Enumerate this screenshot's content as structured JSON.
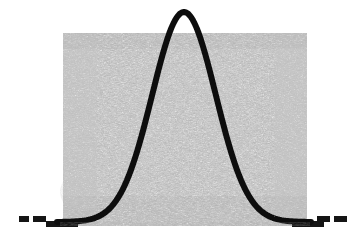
{
  "figure": {
    "kind": "scanned-bell-curve-figure",
    "width": 362,
    "height": 246,
    "background_color": "#ffffff",
    "ink_color": "#1a1a1a",
    "shading_color": "#8d8d8d",
    "has_visible_text": false,
    "title": "",
    "caption": ""
  },
  "chart_data": {
    "type": "line",
    "title": "",
    "subtitle": "",
    "xlabel": "",
    "ylabel": "",
    "grid": false,
    "legend": false,
    "legend_position": "none",
    "xlim": [
      -4,
      4
    ],
    "ylim": [
      0,
      1
    ],
    "curve_name": "normal-distribution-curve",
    "distribution": {
      "family": "normal",
      "mean": 0,
      "std_dev": 1,
      "peak_x": 0,
      "peak_y": 1
    },
    "x": [
      -4,
      -3.6,
      -3.2,
      -2.8,
      -2.4,
      -2,
      -1.6,
      -1.2,
      -0.8,
      -0.4,
      0,
      0.4,
      0.8,
      1.2,
      1.6,
      2,
      2.4,
      2.8,
      3.2,
      3.6,
      4
    ],
    "y": [
      0.0,
      0.002,
      0.006,
      0.02,
      0.055,
      0.135,
      0.278,
      0.487,
      0.726,
      0.923,
      1.0,
      0.923,
      0.726,
      0.487,
      0.278,
      0.135,
      0.055,
      0.02,
      0.006,
      0.002,
      0.0
    ],
    "series": [
      {
        "name": "normal-curve",
        "values": [
          0.0,
          0.002,
          0.006,
          0.02,
          0.055,
          0.135,
          0.278,
          0.487,
          0.726,
          0.923,
          1.0,
          0.923,
          0.726,
          0.487,
          0.278,
          0.135,
          0.055,
          0.02,
          0.006,
          0.002,
          0.0
        ]
      }
    ],
    "annotations": [
      {
        "name": "shaded-region",
        "kind": "rectangle-halftone-fill",
        "x_range": [
          -3.2,
          3.2
        ],
        "y_range": [
          0,
          1.07
        ],
        "description": "stippled gray rectangular background block behind the curve"
      },
      {
        "name": "baseline-axis",
        "kind": "horizontal-rule",
        "y": 0,
        "description": "solid dark baseline running the full width"
      },
      {
        "name": "left-dashed-tail",
        "kind": "dashed-segments",
        "segment_count": 2,
        "description": "two short dashes continuing the curve tail left of the shaded block"
      },
      {
        "name": "right-dashed-tail",
        "kind": "dashed-segments",
        "segment_count": 2,
        "description": "two short dashes continuing the curve tail right of the shaded block"
      }
    ]
  },
  "geometry": {
    "shaded_rect": {
      "x": 63,
      "y": 33,
      "width": 244,
      "height": 193
    },
    "baseline": {
      "x1": 14,
      "x2": 352,
      "y": 227,
      "thickness": 3
    },
    "curve": {
      "peak": {
        "x": 183,
        "y": 12
      },
      "left_foot": {
        "x": 57,
        "y": 222
      },
      "right_foot": {
        "x": 311,
        "y": 222
      },
      "stroke_width": 6
    },
    "left_dashes": [
      {
        "x": 19,
        "y": 216,
        "width": 10,
        "height": 6
      },
      {
        "x": 33,
        "y": 216,
        "width": 13,
        "height": 6
      }
    ],
    "right_dashes": [
      {
        "x": 317,
        "y": 216,
        "width": 13,
        "height": 6
      },
      {
        "x": 334,
        "y": 216,
        "width": 13,
        "height": 6
      }
    ]
  }
}
